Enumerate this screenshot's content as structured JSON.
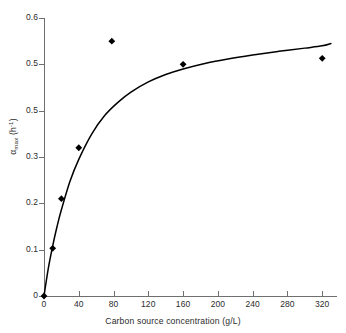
{
  "chart_data": {
    "type": "scatter",
    "title": "",
    "subtitle": "",
    "xlabel": "Carbon source concentration (g/L)",
    "ylabel_parts": {
      "symbol": "α",
      "subscript": "max",
      "unit_base": " (h",
      "unit_exponent": "-1",
      "unit_close": ")"
    },
    "ylabel": "αmax (h-1)",
    "xlim": [
      0,
      337
    ],
    "ylim": [
      0,
      0.6
    ],
    "xticks": [
      0,
      40,
      80,
      120,
      160,
      200,
      240,
      280,
      320
    ],
    "xtick_labels": [
      "0",
      "40",
      "80",
      "120",
      "160",
      "200",
      "240",
      "280",
      "320"
    ],
    "yticks": [
      0,
      0.1,
      0.2,
      0.3,
      0.4,
      0.5,
      0.6
    ],
    "ytick_labels": [
      "0",
      "0.1",
      "0.2",
      "0.3",
      "0.5",
      "0.5",
      "0.6"
    ],
    "grid": false,
    "legend": false,
    "legend_position": "none",
    "marker": "diamond",
    "marker_color": "#000000",
    "line_color": "#000000",
    "series": [
      {
        "name": "Measured specific growth rate",
        "type": "scatter",
        "x": [
          0,
          10,
          20,
          40,
          78,
          160,
          320
        ],
        "y": [
          0.0,
          0.103,
          0.21,
          0.32,
          0.55,
          0.5,
          0.513
        ]
      },
      {
        "name": "Fitted saturation curve",
        "type": "line",
        "x": [
          0,
          5,
          10,
          15,
          20,
          30,
          40,
          55,
          70,
          85,
          100,
          120,
          140,
          160,
          185,
          210,
          240,
          270,
          300,
          320,
          330
        ],
        "y": [
          0.0,
          0.06,
          0.108,
          0.15,
          0.186,
          0.248,
          0.295,
          0.35,
          0.39,
          0.418,
          0.44,
          0.462,
          0.478,
          0.49,
          0.502,
          0.511,
          0.52,
          0.528,
          0.535,
          0.54,
          0.545
        ]
      }
    ]
  },
  "axis": {
    "line_color": "#6f6f6f",
    "text_color": "#2b2b2b"
  }
}
